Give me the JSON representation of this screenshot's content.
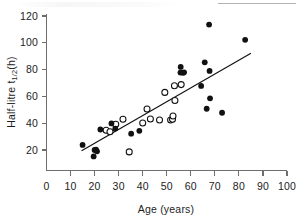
{
  "chart_data": {
    "type": "scatter",
    "title": "",
    "xlabel": "Age (years)",
    "ylabel": "Half-litre t1/2 (h)",
    "ylabel_parts": {
      "main": "Half-litre t",
      "subscript": "1/2",
      "unit": "(h)"
    },
    "xlim": [
      0,
      100
    ],
    "ylim": [
      0,
      120
    ],
    "xticks": [
      0,
      10,
      20,
      30,
      40,
      50,
      60,
      70,
      80,
      90,
      100
    ],
    "xticklabels": [
      "0",
      "10",
      "20",
      "30",
      "40",
      "50",
      "60",
      "70",
      "80",
      "90",
      "100"
    ],
    "yticks": [
      20,
      40,
      60,
      80,
      100,
      120
    ],
    "yticklabels": [
      "20",
      "40",
      "60",
      "80",
      "100",
      "120"
    ],
    "grid": false,
    "legend": null,
    "axis_style": "two-spine-left-bottom",
    "marker_colors": {
      "filled": "#111111",
      "open_fill": "#ffffff",
      "open_stroke": "#111111",
      "fitline": "#111111",
      "axis": "#6e6e6e"
    },
    "series": [
      {
        "name": "filled",
        "marker": "filled-circle",
        "points": [
          [
            15.0,
            23.8
          ],
          [
            19.6,
            15.2
          ],
          [
            20.0,
            20.0
          ],
          [
            20.6,
            20.2
          ],
          [
            21.0,
            19.0
          ],
          [
            22.4,
            35.3
          ],
          [
            27.0,
            39.8
          ],
          [
            28.6,
            36.0
          ],
          [
            35.2,
            32.2
          ],
          [
            38.6,
            34.3
          ],
          [
            55.8,
            82.0
          ],
          [
            55.7,
            77.8
          ],
          [
            56.8,
            77.6
          ],
          [
            57.2,
            78.0
          ],
          [
            64.3,
            67.8
          ],
          [
            65.8,
            85.4
          ],
          [
            66.6,
            50.8
          ],
          [
            67.6,
            113.6
          ],
          [
            67.8,
            79.0
          ],
          [
            68.0,
            58.6
          ],
          [
            73.0,
            47.8
          ],
          [
            82.6,
            102.2
          ]
        ]
      },
      {
        "name": "open",
        "marker": "open-circle",
        "points": [
          [
            24.8,
            34.8
          ],
          [
            26.4,
            33.6
          ],
          [
            28.8,
            39.2
          ],
          [
            31.8,
            43.0
          ],
          [
            34.4,
            18.6
          ],
          [
            40.0,
            40.2
          ],
          [
            41.8,
            50.6
          ],
          [
            43.2,
            43.2
          ],
          [
            47.0,
            42.4
          ],
          [
            49.2,
            63.0
          ],
          [
            51.6,
            42.4
          ],
          [
            52.4,
            43.0
          ],
          [
            52.6,
            45.4
          ],
          [
            53.2,
            68.0
          ],
          [
            53.4,
            57.0
          ],
          [
            56.0,
            68.8
          ]
        ]
      }
    ],
    "fit_line": {
      "type": "linear-regression",
      "x_start": 14.6,
      "y_start": 19.4,
      "x_end": 85.0,
      "y_end": 92.2
    }
  }
}
